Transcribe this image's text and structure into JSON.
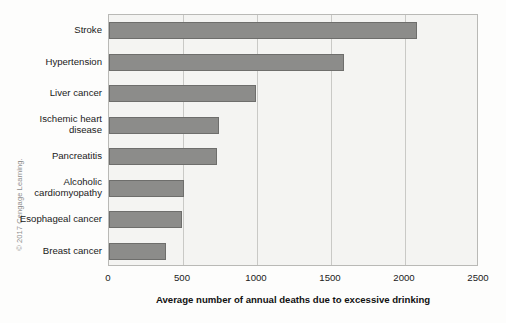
{
  "figure": {
    "copyright": "© 2017 Cengage Learning."
  },
  "chart_data": {
    "type": "bar",
    "orientation": "horizontal",
    "title": "",
    "xlabel": "Average number of annual deaths due to excessive drinking",
    "ylabel": "",
    "categories": [
      "Stroke",
      "Hypertension",
      "Liver cancer",
      "Ischemic heart disease",
      "Pancreatitis",
      "Alcoholic cardiomyopathy",
      "Esophageal cancer",
      "Breast cancer"
    ],
    "values": [
      2080,
      1590,
      990,
      740,
      730,
      510,
      495,
      385
    ],
    "xlim": [
      0,
      2500
    ],
    "xticks": [
      0,
      500,
      1000,
      1500,
      2000,
      2500
    ],
    "xtick_labels": [
      "0",
      "500",
      "1000",
      "1500",
      "2000",
      "2500"
    ],
    "grid": "vertical",
    "legend": "none",
    "bar_color": "#8c8c8a",
    "bar_edge_color": "#6e6e6c",
    "plot_background": "#f4f4f2",
    "frame_color": "#b9b9b6"
  }
}
